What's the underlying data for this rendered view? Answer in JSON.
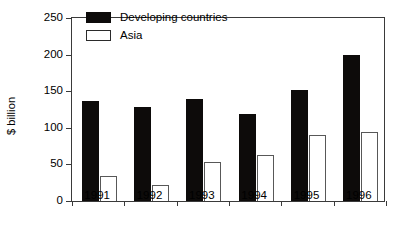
{
  "chart_data": {
    "type": "bar",
    "title": "",
    "subtitle": "",
    "xlabel": "",
    "ylabel": "$ billion",
    "categories": [
      "1991",
      "1992",
      "1993",
      "1994",
      "1995",
      "1996"
    ],
    "series": [
      {
        "name": "Developing countries",
        "color": "#000000",
        "fill": "solid",
        "values": [
          136,
          128,
          140,
          119,
          152,
          200
        ]
      },
      {
        "name": "Asia",
        "color": "#ffffff",
        "fill": "outline",
        "values": [
          34,
          22,
          53,
          63,
          90,
          94
        ]
      }
    ],
    "ylim": [
      0,
      250
    ],
    "yticks": [
      0,
      50,
      100,
      150,
      200,
      250
    ],
    "ytick_labels": [
      "0",
      "50",
      "100",
      "150",
      "200",
      "250"
    ],
    "grid": false,
    "legend_position": "top-center-inside",
    "frame": "full-box"
  },
  "axes": {
    "y_title": "$ billion"
  },
  "legend": {
    "entries": [
      {
        "label": "Developing countries",
        "swatch": "solid-black"
      },
      {
        "label": "Asia",
        "swatch": "outline-white"
      }
    ]
  }
}
